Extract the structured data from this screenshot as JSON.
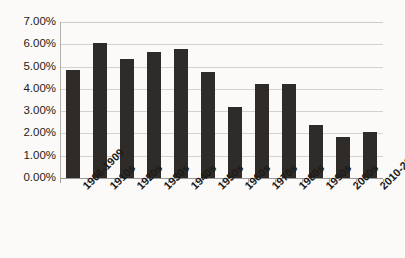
{
  "chart_data": {
    "type": "bar",
    "title": "",
    "xlabel": "",
    "ylabel": "",
    "categories": [
      "1906-1909",
      "1910s",
      "1920s",
      "1930s",
      "1940s",
      "1950s",
      "1960s",
      "1970s",
      "1980s",
      "1990s",
      "2000s",
      "2010-2015"
    ],
    "values": [
      4.85,
      6.05,
      5.35,
      5.65,
      5.8,
      4.75,
      3.2,
      4.2,
      4.2,
      2.4,
      1.85,
      2.05
    ],
    "value_unit": "%",
    "ylim": [
      0,
      7
    ],
    "ytick_labels": [
      "0.00%",
      "1.00%",
      "2.00%",
      "3.00%",
      "4.00%",
      "5.00%",
      "6.00%",
      "7.00%"
    ],
    "ytick_values": [
      0,
      1,
      2,
      3,
      4,
      5,
      6,
      7
    ],
    "grid": true,
    "legend": false,
    "bar_color": "#2e2b28",
    "grid_color": "#d4d2ce",
    "background_color": "#fbfaf8"
  }
}
